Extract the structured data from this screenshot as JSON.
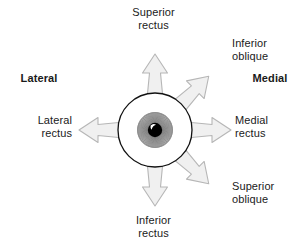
{
  "figure": {
    "background_color": "#ffffff"
  },
  "orientation_labels": {
    "left": "Lateral",
    "right": "Medial"
  },
  "muscles": [
    {
      "id": "superior-rectus",
      "label": "Superior\nrectus",
      "direction": "up",
      "angle_deg": 90
    },
    {
      "id": "inferior-oblique",
      "label": "Inferior\noblique",
      "direction": "up-right",
      "angle_deg": 45
    },
    {
      "id": "medial-rectus",
      "label": "Medial\nrectus",
      "direction": "right",
      "angle_deg": 0
    },
    {
      "id": "superior-oblique",
      "label": "Superior\noblique",
      "direction": "down-right",
      "angle_deg": -45
    },
    {
      "id": "inferior-rectus",
      "label": "Inferior\nrectus",
      "direction": "down",
      "angle_deg": -90
    },
    {
      "id": "lateral-rectus",
      "label": "Lateral\nrectus",
      "direction": "left",
      "angle_deg": 180
    }
  ],
  "eye": {
    "center_x": 155,
    "center_y": 130,
    "sclera_radius": 37,
    "iris_radius": 17,
    "pupil_radius": 7,
    "sclera_fill": "#ffffff",
    "sclera_stroke": "#111111",
    "iris_fill": "#a8a8a8",
    "pupil_fill": "#000000",
    "highlight_fill": "#ffffff"
  },
  "arrow_style": {
    "fill": "#f0f0f0",
    "stroke": "#b3b3b3"
  }
}
